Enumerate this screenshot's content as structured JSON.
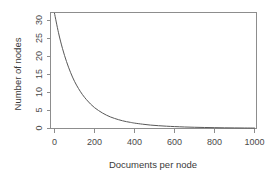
{
  "chart_data": {
    "type": "line",
    "title": "",
    "xlabel": "Documents per node",
    "ylabel": "Number of nodes",
    "xlim": [
      0,
      1040
    ],
    "ylim": [
      0,
      32.5
    ],
    "xticks": [
      0,
      200,
      400,
      600,
      800,
      1000
    ],
    "xtick_labels": [
      "0",
      "200",
      "400",
      "600",
      "800",
      "1000"
    ],
    "yticks": [
      0,
      5,
      10,
      15,
      20,
      25,
      30
    ],
    "ytick_labels": [
      "0",
      "5",
      "10",
      "15",
      "20",
      "25",
      "30"
    ],
    "grid": false,
    "legend": null,
    "series": [
      {
        "name": "Number of nodes",
        "x": [
          0,
          20,
          40,
          60,
          80,
          100,
          120,
          140,
          160,
          180,
          200,
          220,
          240,
          260,
          280,
          300,
          320,
          340,
          360,
          380,
          400,
          440,
          480,
          520,
          560,
          600,
          650,
          700,
          750,
          800,
          850,
          900,
          950,
          1000
        ],
        "values": [
          32.0,
          26.6,
          22.2,
          18.6,
          15.6,
          13.1,
          11.1,
          9.4,
          8.0,
          6.8,
          5.8,
          5.0,
          4.3,
          3.7,
          3.2,
          2.8,
          2.45,
          2.15,
          1.9,
          1.7,
          1.5,
          1.2,
          0.95,
          0.78,
          0.64,
          0.53,
          0.42,
          0.34,
          0.28,
          0.23,
          0.19,
          0.16,
          0.14,
          0.12
        ]
      }
    ],
    "colors": {
      "curve": "#585858",
      "axis": "#8d8d8d",
      "text": "#3a3a3a",
      "background": "#ffffff"
    }
  }
}
